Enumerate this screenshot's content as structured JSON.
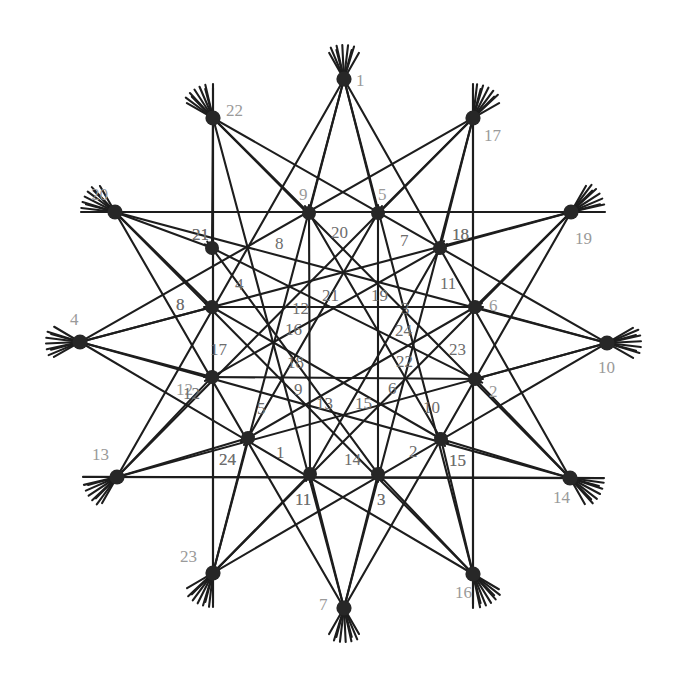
{
  "figure": {
    "background_color": "#ffffff",
    "line_color": "#1d1d1d",
    "node_color": "#272727",
    "outer_label_color": "#9a9a9a",
    "inner_label_color": "#6d6d6d",
    "width": 681,
    "height": 682
  },
  "chart_data": {
    "type": "diagram",
    "node_count": 36,
    "outer_ring": {
      "count": 16,
      "center": [
        344,
        343
      ],
      "labels": [
        "1",
        "22",
        "17",
        "20",
        "19",
        "4",
        "10",
        "13",
        "14",
        "23",
        "16",
        "7",
        "8",
        "12",
        "21",
        "18"
      ]
    },
    "nodes": [
      {
        "id": "n1",
        "label": "1",
        "x": 344,
        "y": 79,
        "ring": "outer",
        "lx": 356,
        "ly": 72
      },
      {
        "id": "n22",
        "label": "22",
        "x": 213,
        "y": 118,
        "ring": "outer",
        "lx": 226,
        "ly": 102
      },
      {
        "id": "n17",
        "label": "17",
        "x": 473,
        "y": 118,
        "ring": "outer",
        "lx": 484,
        "ly": 127
      },
      {
        "id": "n20",
        "label": "20",
        "x": 115,
        "y": 212,
        "ring": "outer",
        "lx": 91,
        "ly": 186
      },
      {
        "id": "n19",
        "label": "19",
        "x": 571,
        "y": 212,
        "ring": "outer",
        "lx": 575,
        "ly": 230
      },
      {
        "id": "n4",
        "label": "4",
        "x": 80,
        "y": 342,
        "ring": "outer",
        "lx": 70,
        "ly": 311
      },
      {
        "id": "n10",
        "label": "10",
        "x": 607,
        "y": 343,
        "ring": "outer",
        "lx": 598,
        "ly": 359
      },
      {
        "id": "n13",
        "label": "13",
        "x": 117,
        "y": 477,
        "ring": "outer",
        "lx": 92,
        "ly": 446
      },
      {
        "id": "n14",
        "label": "14",
        "x": 570,
        "y": 478,
        "ring": "outer",
        "lx": 553,
        "ly": 489
      },
      {
        "id": "n23",
        "label": "23",
        "x": 213,
        "y": 573,
        "ring": "outer",
        "lx": 180,
        "ly": 548
      },
      {
        "id": "n16",
        "label": "16",
        "x": 473,
        "y": 574,
        "ring": "outer",
        "lx": 455,
        "ly": 584
      },
      {
        "id": "n7",
        "label": "7",
        "x": 344,
        "y": 608,
        "ring": "outer",
        "lx": 319,
        "ly": 596
      },
      {
        "id": "n9",
        "label": "9",
        "x": 309,
        "y": 213,
        "ring": "mid",
        "lx": 299,
        "ly": 186
      },
      {
        "id": "n5",
        "label": "5",
        "x": 378,
        "y": 213,
        "ring": "mid",
        "lx": 378,
        "ly": 186
      },
      {
        "id": "n21",
        "label": "21",
        "x": 212,
        "y": 248,
        "ring": "mid",
        "lx": 192,
        "ly": 226
      },
      {
        "id": "n18",
        "label": "18",
        "x": 440,
        "y": 248,
        "ring": "mid",
        "lx": 452,
        "ly": 226
      },
      {
        "id": "n8",
        "label": "8",
        "x": 212,
        "y": 307,
        "ring": "mid",
        "lx": 176,
        "ly": 296
      },
      {
        "id": "n6",
        "label": "6",
        "x": 475,
        "y": 307,
        "ring": "mid",
        "lx": 489,
        "ly": 297
      },
      {
        "id": "n12",
        "label": "12",
        "x": 212,
        "y": 377,
        "ring": "mid",
        "lx": 176,
        "ly": 381
      },
      {
        "id": "n2",
        "label": "2",
        "x": 475,
        "y": 379,
        "ring": "mid",
        "lx": 489,
        "ly": 383
      },
      {
        "id": "n24",
        "label": "24",
        "x": 248,
        "y": 438,
        "ring": "mid",
        "lx": 219,
        "ly": 451
      },
      {
        "id": "n15",
        "label": "15",
        "x": 441,
        "y": 439,
        "ring": "mid",
        "lx": 449,
        "ly": 452
      },
      {
        "id": "n11",
        "label": "11",
        "x": 310,
        "y": 474,
        "ring": "mid",
        "lx": 295,
        "ly": 491
      },
      {
        "id": "n3",
        "label": "3",
        "x": 378,
        "y": 474,
        "ring": "mid",
        "lx": 377,
        "ly": 491
      }
    ],
    "interior_labels": [
      {
        "text": "20",
        "x": 331,
        "y": 224
      },
      {
        "text": "7",
        "x": 400,
        "y": 232
      },
      {
        "text": "8",
        "x": 275,
        "y": 235
      },
      {
        "text": "4",
        "x": 235,
        "y": 276
      },
      {
        "text": "11",
        "x": 440,
        "y": 275
      },
      {
        "text": "21",
        "x": 322,
        "y": 287
      },
      {
        "text": "19",
        "x": 371,
        "y": 287
      },
      {
        "text": "12",
        "x": 292,
        "y": 300
      },
      {
        "text": "3",
        "x": 401,
        "y": 300
      },
      {
        "text": "16",
        "x": 285,
        "y": 321
      },
      {
        "text": "24",
        "x": 395,
        "y": 322
      },
      {
        "text": "17",
        "x": 210,
        "y": 341
      },
      {
        "text": "23",
        "x": 449,
        "y": 341
      },
      {
        "text": "18",
        "x": 287,
        "y": 354
      },
      {
        "text": "22",
        "x": 396,
        "y": 353
      },
      {
        "text": "9",
        "x": 294,
        "y": 381
      },
      {
        "text": "6",
        "x": 388,
        "y": 380
      },
      {
        "text": "5",
        "x": 257,
        "y": 400
      },
      {
        "text": "10",
        "x": 423,
        "y": 399
      },
      {
        "text": "13",
        "x": 316,
        "y": 395
      },
      {
        "text": "15",
        "x": 355,
        "y": 395
      },
      {
        "text": "12",
        "x": 183,
        "y": 385
      },
      {
        "text": "8",
        "x": 176,
        "y": 296
      },
      {
        "text": "24",
        "x": 219,
        "y": 451
      },
      {
        "text": "1",
        "x": 276,
        "y": 444
      },
      {
        "text": "14",
        "x": 344,
        "y": 451
      },
      {
        "text": "2",
        "x": 409,
        "y": 443
      },
      {
        "text": "11",
        "x": 295,
        "y": 491
      },
      {
        "text": "3",
        "x": 377,
        "y": 491
      },
      {
        "text": "15",
        "x": 449,
        "y": 452
      },
      {
        "text": "21",
        "x": 192,
        "y": 226
      },
      {
        "text": "18",
        "x": 452,
        "y": 226
      }
    ]
  }
}
